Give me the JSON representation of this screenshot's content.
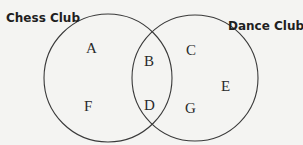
{
  "diagram": {
    "type": "venn",
    "sets": [
      {
        "name": "Chess Club",
        "cx": 108,
        "cy": 78,
        "r": 64
      },
      {
        "name": "Dance Club",
        "cx": 195,
        "cy": 78,
        "r": 63
      }
    ],
    "regions": [
      {
        "label": "A",
        "x": 91,
        "y": 48
      },
      {
        "label": "B",
        "x": 150,
        "y": 61
      },
      {
        "label": "C",
        "x": 191,
        "y": 52
      },
      {
        "label": "D",
        "x": 150,
        "y": 106
      },
      {
        "label": "E",
        "x": 225,
        "y": 88
      },
      {
        "label": "F",
        "x": 89,
        "y": 108
      },
      {
        "label": "G",
        "x": 190,
        "y": 110
      }
    ],
    "colors": {
      "line": "#3a3a3a",
      "background": "#f4f4f2"
    }
  }
}
